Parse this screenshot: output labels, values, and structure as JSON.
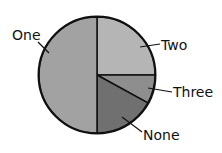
{
  "chart_data": {
    "type": "pie",
    "title": "",
    "categories": [
      "Two",
      "Three",
      "None",
      "One"
    ],
    "values": [
      25,
      8,
      17,
      50
    ],
    "unit": "percent (estimated)",
    "start_angle": "12 o'clock, clockwise",
    "colors": {
      "Two": "#b5b5b5",
      "Three": "#8e8e8e",
      "None": "#707070",
      "One": "#a2a2a2"
    },
    "legend": "none (direct labels with leader lines)"
  },
  "labels": {
    "one": "One",
    "two": "Two",
    "three": "Three",
    "none": "None"
  }
}
